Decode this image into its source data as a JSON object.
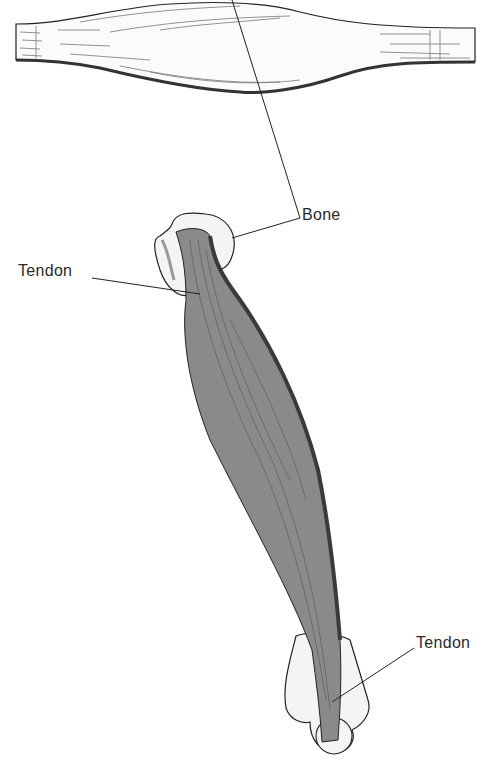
{
  "figure": {
    "top_illustration": "spindle-shaped muscle (isolated)",
    "bottom_illustration": "muscle attached to bones via tendons"
  },
  "labels": {
    "bone": "Bone",
    "tendon_top": "Tendon",
    "tendon_bottom": "Tendon"
  },
  "colors": {
    "muscle_fill": "#8a8a8a",
    "muscle_dark": "#3a3a3a",
    "bone_fill": "#f4f4f4",
    "line": "#222222"
  }
}
